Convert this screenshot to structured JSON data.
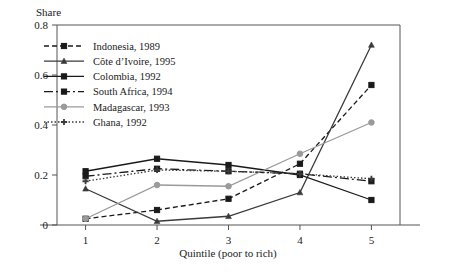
{
  "chart_data": {
    "type": "line",
    "title": "",
    "ylabel": "Share",
    "xlabel": "Quintile (poor to rich)",
    "categories": [
      "1",
      "2",
      "3",
      "4",
      "5"
    ],
    "x": [
      1,
      2,
      3,
      4,
      5
    ],
    "ylim": [
      0,
      0.8
    ],
    "xlim": [
      0.6,
      5.4
    ],
    "ytick_labels": [
      "0",
      "0.2",
      "0.4",
      "0.6",
      "0.8"
    ],
    "yticks": [
      0,
      0.2,
      0.4,
      0.6,
      0.8
    ],
    "xtick_labels": [
      "1",
      "2",
      "3",
      "4",
      "5"
    ],
    "grid": false,
    "legend_position": "top-left-inside",
    "series": [
      {
        "name": "Indonesia, 1989",
        "values": [
          0.025,
          0.06,
          0.105,
          0.245,
          0.56
        ],
        "color": "#1a1a1a",
        "dash": "5,3",
        "marker": "square"
      },
      {
        "name": "Côte d’Ivoire, 1995",
        "values": [
          0.145,
          0.015,
          0.035,
          0.13,
          0.72
        ],
        "color": "#3a3a3a",
        "dash": "none",
        "marker": "triangle"
      },
      {
        "name": "Colombia, 1992",
        "values": [
          0.215,
          0.265,
          0.24,
          0.2,
          0.1
        ],
        "color": "#1a1a1a",
        "dash": "none",
        "marker": "square"
      },
      {
        "name": "South Africa, 1994",
        "values": [
          0.195,
          0.225,
          0.215,
          0.205,
          0.175
        ],
        "color": "#1a1a1a",
        "dash": "9,3,2,3",
        "marker": "square"
      },
      {
        "name": "Madagascar, 1993",
        "values": [
          0.025,
          0.16,
          0.155,
          0.285,
          0.41
        ],
        "color": "#9a9a9a",
        "dash": "none",
        "marker": "circle"
      },
      {
        "name": "Ghana, 1992",
        "values": [
          0.175,
          0.22,
          0.215,
          0.205,
          0.185
        ],
        "color": "#3a3a3a",
        "dash": "1.5,2",
        "marker": "plus"
      }
    ]
  }
}
